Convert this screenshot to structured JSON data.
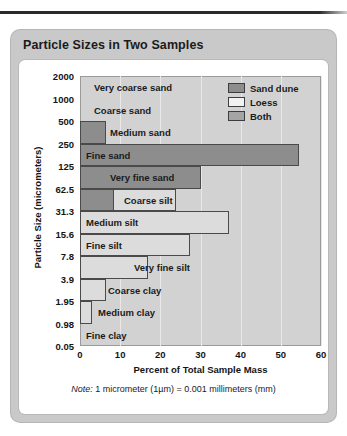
{
  "top_rule": "decorative-rule",
  "card": {
    "title": "Particle Sizes in Two Samples"
  },
  "note": {
    "prefix": "Note:",
    "text": " 1 micrometer (1µm) = 0.001 millimeters (mm)"
  },
  "legend": {
    "items": [
      {
        "label": "Sand dune",
        "color": "#8d8d8d",
        "key": "dune"
      },
      {
        "label": "Loess",
        "color": "#f2f2f2",
        "key": "loess"
      },
      {
        "label": "Both",
        "color": "#a5a5a5",
        "key": "both"
      }
    ]
  },
  "chart_data": {
    "type": "bar",
    "orientation": "horizontal",
    "title": "Particle Sizes in Two Samples",
    "xlabel": "Percent of Total Sample Mass",
    "ylabel": "Particle Size (micrometers)",
    "xlim": [
      0,
      60
    ],
    "xticks": [
      0,
      10,
      20,
      30,
      40,
      50,
      60
    ],
    "yticks": [
      "2000",
      "1000",
      "500",
      "250",
      "125",
      "62.5",
      "31.3",
      "15.6",
      "7.8",
      "3.9",
      "1.95",
      "0.98",
      "0.05"
    ],
    "grid": true,
    "legend_position": "top-right",
    "categories": [
      "Very coarse sand",
      "Coarse sand",
      "Medium sand",
      "Fine sand",
      "Very fine sand",
      "Coarse silt",
      "Medium silt",
      "Fine silt",
      "Very fine silt",
      "Coarse clay",
      "Medium clay",
      "Fine clay"
    ],
    "series": [
      {
        "name": "Sand dune",
        "color": "#8d8d8d",
        "values": [
          0,
          0,
          6.5,
          54.5,
          30,
          8.5,
          0,
          0,
          0,
          0,
          0,
          0
        ]
      },
      {
        "name": "Loess",
        "color": "#dcdcdc",
        "values": [
          0,
          0,
          0,
          0,
          7.5,
          24,
          37,
          27.5,
          17,
          6.5,
          3,
          0
        ]
      }
    ],
    "bars": [
      {
        "label": "Very coarse sand",
        "y_top": "2000",
        "y_bottom": "1000",
        "dune": 0,
        "loess": 0,
        "label_indent": 14
      },
      {
        "label": "Coarse sand",
        "y_top": "1000",
        "y_bottom": "500",
        "dune": 0,
        "loess": 0,
        "label_indent": 14
      },
      {
        "label": "Medium sand",
        "y_top": "500",
        "y_bottom": "250",
        "dune": 6.5,
        "loess": 0,
        "label_indent": 30
      },
      {
        "label": "Fine sand",
        "y_top": "250",
        "y_bottom": "125",
        "dune": 54.5,
        "loess": 0,
        "label_indent": 6
      },
      {
        "label": "Very fine sand",
        "y_top": "125",
        "y_bottom": "62.5",
        "dune": 30,
        "loess": 7.5,
        "label_indent": 30
      },
      {
        "label": "Coarse silt",
        "y_top": "62.5",
        "y_bottom": "31.3",
        "dune": 8.5,
        "loess": 24,
        "label_indent": 44
      },
      {
        "label": "Medium silt",
        "y_top": "31.3",
        "y_bottom": "15.6",
        "dune": 0,
        "loess": 37,
        "label_indent": 6
      },
      {
        "label": "Fine silt",
        "y_top": "15.6",
        "y_bottom": "7.8",
        "dune": 0,
        "loess": 27.5,
        "label_indent": 6
      },
      {
        "label": "Very fine silt",
        "y_top": "7.8",
        "y_bottom": "3.9",
        "dune": 0,
        "loess": 17,
        "label_indent": 54
      },
      {
        "label": "Coarse clay",
        "y_top": "3.9",
        "y_bottom": "1.95",
        "dune": 0,
        "loess": 6.5,
        "label_indent": 28
      },
      {
        "label": "Medium clay",
        "y_top": "1.95",
        "y_bottom": "0.98",
        "dune": 0,
        "loess": 3,
        "label_indent": 18
      },
      {
        "label": "Fine clay",
        "y_top": "0.98",
        "y_bottom": "0.05",
        "dune": 0,
        "loess": 0,
        "label_indent": 6
      }
    ]
  }
}
